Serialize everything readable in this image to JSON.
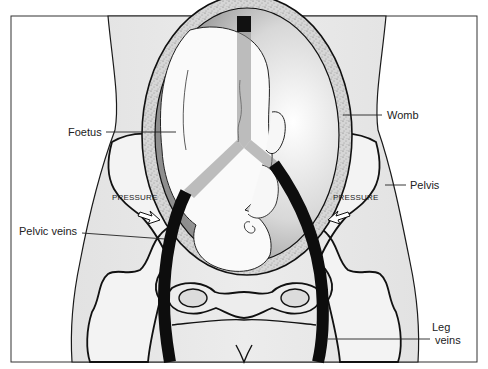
{
  "diagram": {
    "colors": {
      "background": "#ffffff",
      "body_fill": "#e6e6e6",
      "bone_fill": "#f4f4f4",
      "womb_wall": "#d2d2d2",
      "vein": "#111111",
      "outline": "#1a1a1a",
      "cavity_shadow": "#9a9a9a"
    },
    "labels": {
      "foetus": "Foetus",
      "womb": "Womb",
      "pelvis": "Pelvis",
      "pelvic_veins": "Pelvic veins",
      "leg_veins_line1": "Leg",
      "leg_veins_line2": "veins",
      "pressure_left": "PRESSURE",
      "pressure_right": "PRESSURE"
    }
  }
}
